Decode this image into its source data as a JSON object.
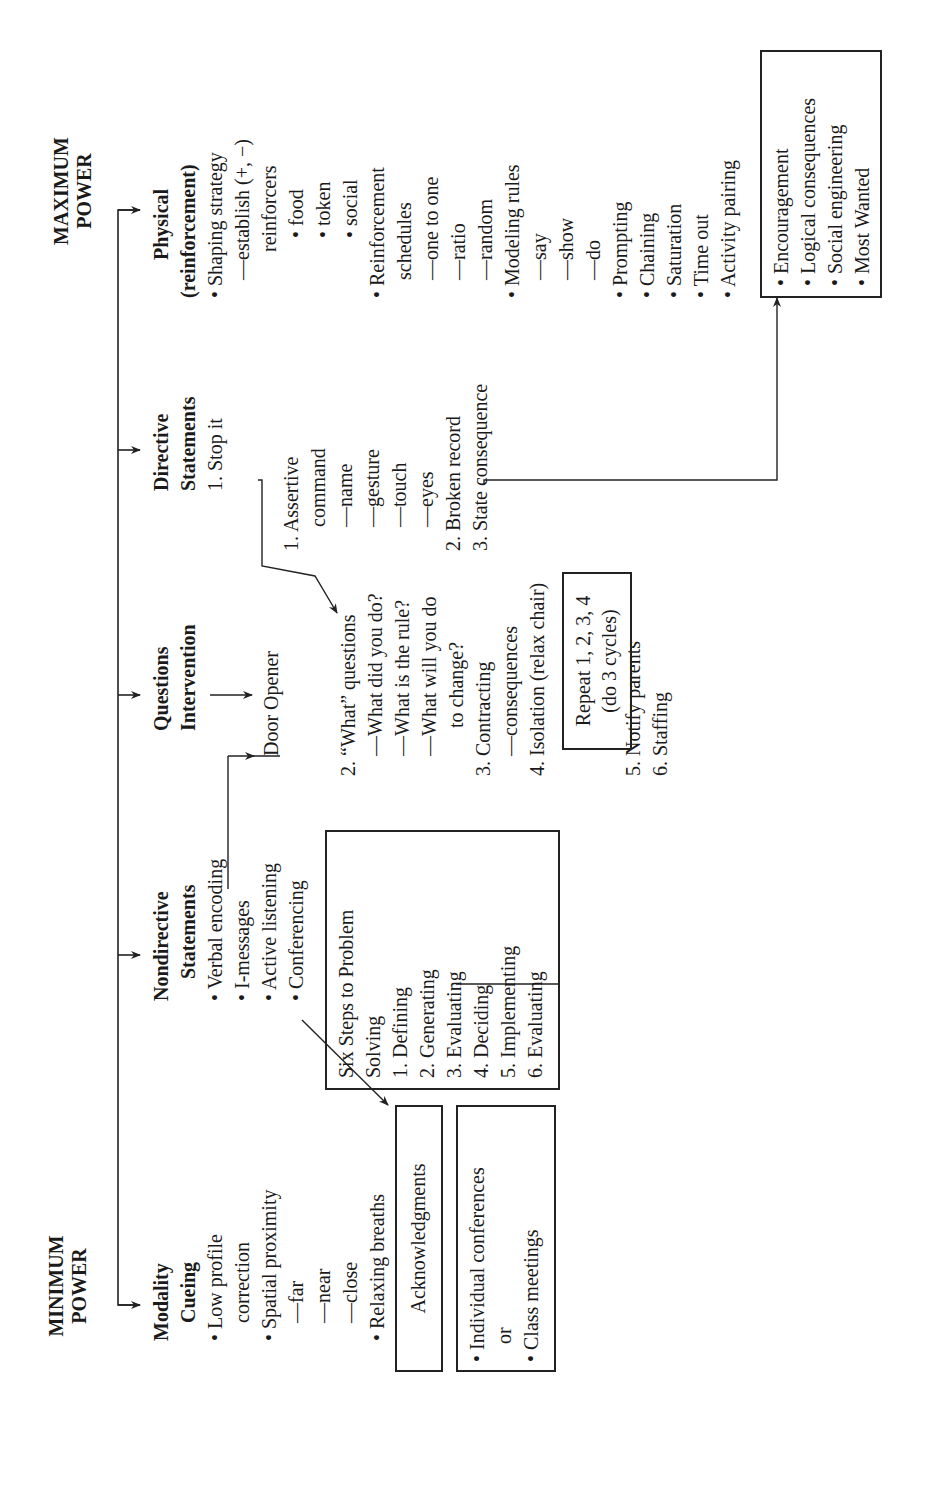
{
  "labels": {
    "minimum_power": [
      "MINIMUM",
      "POWER"
    ],
    "maximum_power": [
      "MAXIMUM",
      "POWER"
    ]
  },
  "columns": {
    "modality": {
      "heading": [
        "Modality",
        "Cueing"
      ],
      "lines": [
        "• Low profile",
        "   correction",
        "• Spatial proximity",
        "   —far",
        "   —near",
        "   —close",
        "• Relaxing breaths"
      ]
    },
    "nondirective": {
      "heading": [
        "Nondirective",
        "Statements"
      ],
      "lines": [
        "• Verbal encoding",
        "• I-messages",
        "• Active listening",
        "• Conferencing"
      ]
    },
    "questions": {
      "heading": [
        "Questions",
        "Intervention"
      ],
      "door_opener": "Door Opener",
      "lines": [
        "2. “What” questions",
        "   —What did you do?",
        "   —What is the rule?",
        "   —What will you do",
        "       to change?",
        "3. Contracting",
        "   —consequences",
        "4. Isolation (relax chair)"
      ],
      "lines_after": [
        "5. Notify parents",
        "6. Staffing"
      ]
    },
    "directive": {
      "heading": [
        "Directive",
        "Statements"
      ],
      "stop_it": "1. Stop it",
      "lines": [
        "1. Assertive",
        "    command",
        "    —name",
        "    —gesture",
        "    —touch",
        "    —eyes",
        "2. Broken record",
        "3. State consequence"
      ]
    },
    "physical": {
      "heading": [
        "Physical",
        "(reinforcement)"
      ],
      "lines": [
        "• Shaping strategy",
        "   —establish (+, −)",
        "       reinforcers",
        "       • food",
        "       • token",
        "       • social",
        "• Reinforcement",
        "   schedules",
        "   —one to one",
        "   —ratio",
        "   —random",
        "• Modeling rules",
        "   —say",
        "   —show",
        "   —do",
        "• Prompting",
        "• Chaining",
        "• Saturation",
        "• Time out",
        "• Activity pairing"
      ]
    }
  },
  "boxes": {
    "acknowledgments": "Acknowledgments",
    "conferences": [
      "• Individual conferences",
      "   or",
      "• Class meetings"
    ],
    "six_steps": [
      "Six Steps to Problem",
      "Solving",
      "1. Defining",
      "2. Generating",
      "3. Evaluating",
      "4. Deciding",
      "5. Implementing",
      "6. Evaluating"
    ],
    "repeat": [
      "Repeat 1, 2, 3, 4",
      "(do 3 cycles)"
    ],
    "encouragement": [
      "• Encouragement",
      "• Logical consequences",
      "• Social engineering",
      "• Most Wanted"
    ]
  },
  "colors": {
    "ink": "#1a1a1a",
    "line": "#222222",
    "background": "#ffffff"
  }
}
